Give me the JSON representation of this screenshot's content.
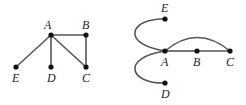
{
  "colors": {
    "edge": "#555555",
    "node": "#111111",
    "label": "#222222"
  },
  "graphs": [
    {
      "name": "left-graph",
      "nodes": [
        {
          "id": "A",
          "label": "A",
          "x": 51,
          "y": 35,
          "lx": 44,
          "ly": 29
        },
        {
          "id": "B",
          "label": "B",
          "x": 86,
          "y": 35,
          "lx": 82,
          "ly": 29
        },
        {
          "id": "C",
          "label": "C",
          "x": 86,
          "y": 67,
          "lx": 82,
          "ly": 82
        },
        {
          "id": "D",
          "label": "D",
          "x": 51,
          "y": 67,
          "lx": 47,
          "ly": 82
        },
        {
          "id": "E",
          "label": "E",
          "x": 16,
          "y": 67,
          "lx": 12,
          "ly": 82
        }
      ],
      "edges": [
        [
          "A",
          "B"
        ],
        [
          "B",
          "C"
        ],
        [
          "A",
          "C"
        ],
        [
          "A",
          "D"
        ],
        [
          "A",
          "E"
        ]
      ]
    },
    {
      "name": "right-graph",
      "nodes": [
        {
          "id": "E",
          "label": "E",
          "x": 165,
          "y": 19,
          "lx": 161,
          "ly": 12
        },
        {
          "id": "A",
          "label": "A",
          "x": 165,
          "y": 51,
          "lx": 161,
          "ly": 66
        },
        {
          "id": "B",
          "label": "B",
          "x": 197,
          "y": 51,
          "lx": 193,
          "ly": 66
        },
        {
          "id": "C",
          "label": "C",
          "x": 230,
          "y": 51,
          "lx": 226,
          "ly": 66
        },
        {
          "id": "D",
          "label": "D",
          "x": 165,
          "y": 83,
          "lx": 161,
          "ly": 98
        }
      ],
      "edges": [
        {
          "from": "A",
          "to": "B",
          "path": "M165 51 L197 51"
        },
        {
          "from": "B",
          "to": "C",
          "path": "M197 51 L230 51"
        },
        {
          "from": "A",
          "to": "C",
          "path": "M165 51 Q197 24 230 51"
        },
        {
          "from": "A",
          "to": "E",
          "path": "M165 51 C120 44 130 18 165 19"
        },
        {
          "from": "A",
          "to": "D",
          "path": "M165 51 C120 58 130 84 165 83"
        }
      ]
    }
  ]
}
